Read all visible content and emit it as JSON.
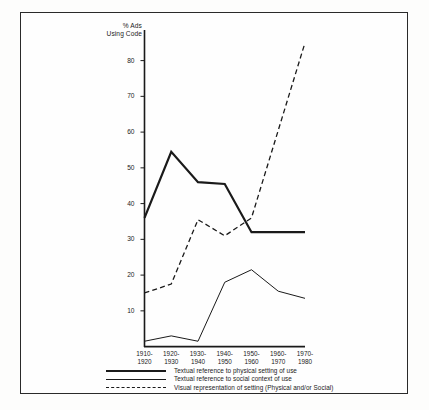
{
  "chart_data": {
    "type": "line",
    "title": "",
    "subtitle": "",
    "xlabel": "",
    "ylabel": "% Ads\nUsing Code",
    "categories": [
      "1910-\n1920",
      "1920-\n1930",
      "1930-\n1940",
      "1940-\n1950",
      "1950-\n1960",
      "1960-\n1970",
      "1970-\n1980"
    ],
    "ylim": [
      0,
      88
    ],
    "yticks": [
      10,
      20,
      30,
      40,
      50,
      60,
      70,
      80
    ],
    "ytick_labels": [
      "10",
      "20",
      "30",
      "40",
      "50",
      "60",
      "70",
      "80"
    ],
    "grid": false,
    "legend_position": "below-axes-left",
    "series": [
      {
        "name": "Textual reference to physical setting of use",
        "style": "solid-thick",
        "color": "#1a1a1a",
        "values": [
          36,
          54.5,
          46,
          45.5,
          32,
          32,
          32
        ]
      },
      {
        "name": "Textual reference to social context of use",
        "style": "solid-thin",
        "color": "#1a1a1a",
        "values": [
          1.5,
          3,
          1.5,
          18,
          21.5,
          15.5,
          13.5
        ]
      },
      {
        "name": "Visual representation of setting (Physical and/or Social)",
        "style": "dashed",
        "color": "#1a1a1a",
        "values": [
          15,
          17.5,
          35.5,
          31,
          36,
          60.5,
          85
        ]
      }
    ]
  },
  "legend": {
    "items": [
      {
        "label": "Textual reference to physical setting of use",
        "swatch": "solid-thick-line-icon"
      },
      {
        "label": "Textual reference to social context of use",
        "swatch": "solid-thin-line-icon"
      },
      {
        "label": "Visual representation of setting (Physical and/or Social)",
        "swatch": "dashed-line-icon"
      }
    ]
  }
}
